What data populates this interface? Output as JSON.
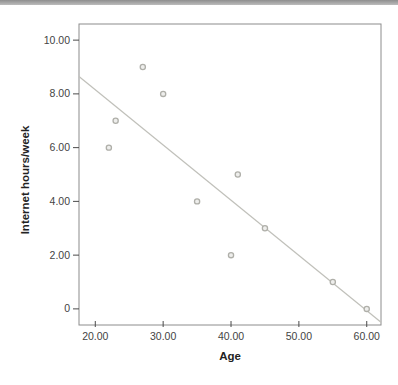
{
  "page": {
    "background": "#ffffff",
    "top_bar": {
      "color_top": "#8e8e8e",
      "color_bottom": "#bcbcbc",
      "height_px": 5
    }
  },
  "chart_data": {
    "type": "scatter",
    "xlabel": "Age",
    "ylabel": "Internet hours/week",
    "points": [
      {
        "x": 22,
        "y": 6
      },
      {
        "x": 23,
        "y": 7
      },
      {
        "x": 27,
        "y": 9
      },
      {
        "x": 30,
        "y": 8
      },
      {
        "x": 35,
        "y": 4
      },
      {
        "x": 40,
        "y": 2
      },
      {
        "x": 41,
        "y": 5
      },
      {
        "x": 45,
        "y": 3
      },
      {
        "x": 55,
        "y": 1
      },
      {
        "x": 60,
        "y": 0
      }
    ],
    "x_ticks": [
      {
        "value": 20,
        "label": "20.00"
      },
      {
        "value": 30,
        "label": "30.00"
      },
      {
        "value": 40,
        "label": "40.00"
      },
      {
        "value": 50,
        "label": "50.00"
      },
      {
        "value": 60,
        "label": "60.00"
      }
    ],
    "y_ticks": [
      {
        "value": 0,
        "label": "0"
      },
      {
        "value": 2,
        "label": "2.00"
      },
      {
        "value": 4,
        "label": "4.00"
      },
      {
        "value": 6,
        "label": "6.00"
      },
      {
        "value": 8,
        "label": "8.00"
      },
      {
        "value": 10,
        "label": "10.00"
      }
    ],
    "xlim": [
      17.6,
      62.1
    ],
    "ylim": [
      -0.6,
      10.6
    ],
    "grid": false,
    "legend": false,
    "fit_line": {
      "slope": -0.2054,
      "intercept": 12.26,
      "x1": 17.6,
      "y1": 8.645,
      "x2": 62.1,
      "y2": -0.495,
      "color": "#c0c0ba"
    },
    "style": {
      "frame_color": "#8c8c8c",
      "tick_color": "#4a4a4a",
      "label_color": "#444444",
      "marker_fill": "#eeeeec",
      "marker_stroke": "#afafa9",
      "marker_radius": 2.6
    }
  }
}
